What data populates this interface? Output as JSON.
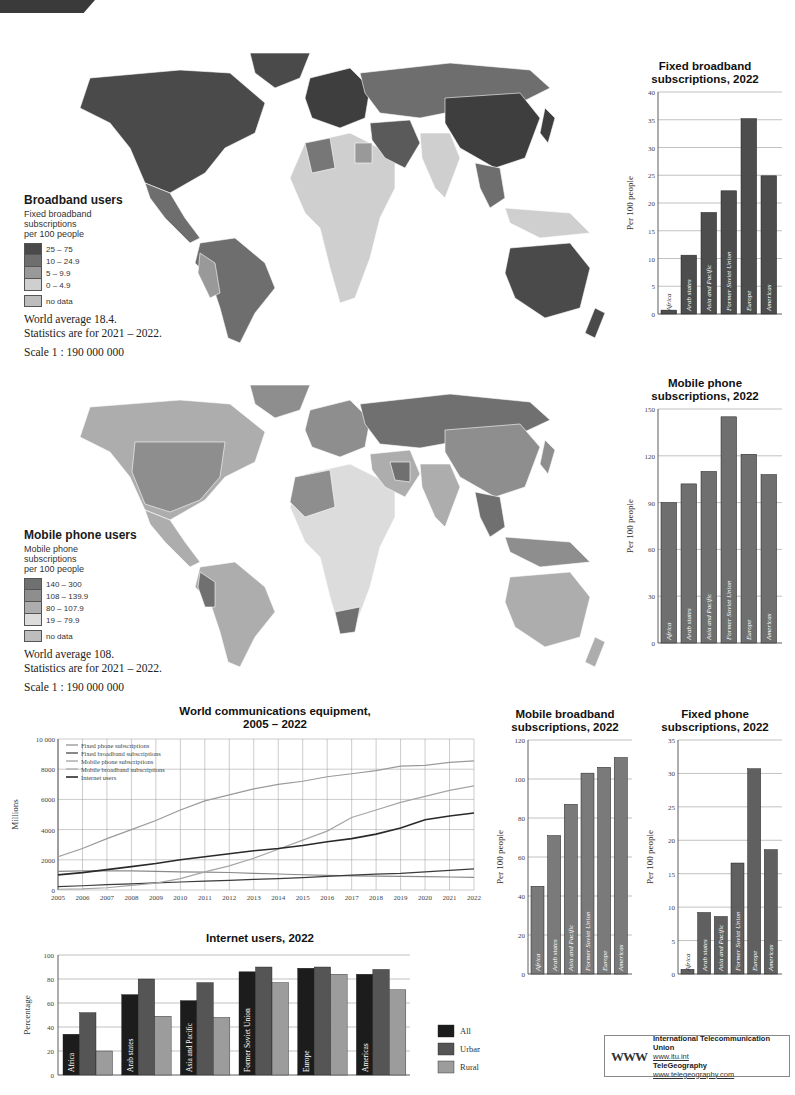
{
  "maps": {
    "broadband": {
      "title": "Broadband users",
      "subtitle": [
        "Fixed broadband",
        "subscriptions",
        "per 100 people"
      ],
      "legend": [
        {
          "label": "25 – 75",
          "color": "#4a4a4a"
        },
        {
          "label": "10 – 24.9",
          "color": "#6e6e6e"
        },
        {
          "label": "5 – 9.9",
          "color": "#999999"
        },
        {
          "label": "0 – 4.9",
          "color": "#cfcfcf"
        }
      ],
      "nodata": {
        "label": "no  data",
        "color": "#bdbdbd"
      },
      "average": "World average 18.4.",
      "stats": "Statistics are for 2021 – 2022.",
      "scale": "Scale 1 : 190 000 000"
    },
    "mobile": {
      "title": "Mobile phone users",
      "subtitle": [
        "Mobile phone",
        "subscriptions",
        "per 100 people"
      ],
      "legend": [
        {
          "label": "140 – 300",
          "color": "#707070"
        },
        {
          "label": "108 – 139.9",
          "color": "#8e8e8e"
        },
        {
          "label": "80 – 107.9",
          "color": "#adadad"
        },
        {
          "label": "19 – 79.9",
          "color": "#dcdcdc"
        }
      ],
      "nodata": {
        "label": "no  data",
        "color": "#bdbdbd"
      },
      "average": "World average 108.",
      "stats": "Statistics are for 2021 – 2022.",
      "scale": "Scale 1 : 190 000 000"
    }
  },
  "chart_data": [
    {
      "id": "fixed_broadband",
      "type": "bar",
      "title": "Fixed broadband subscriptions, 2022",
      "title_lines": [
        "Fixed broadband",
        "subscriptions, 2022"
      ],
      "ylabel": "Per 100 people",
      "ylim": [
        0,
        40
      ],
      "yticks": [
        0,
        5,
        10,
        15,
        20,
        25,
        30,
        35,
        40
      ],
      "categories": [
        "Africa",
        "Arab states",
        "Asia and Pacific",
        "Former Soviet Union",
        "Europe",
        "Americas"
      ],
      "values": [
        0.7,
        10.6,
        18.3,
        22.2,
        35.2,
        24.9
      ],
      "color": "#4d4d4d"
    },
    {
      "id": "mobile_phone",
      "type": "bar",
      "title": "Mobile phone subscriptions, 2022",
      "title_lines": [
        "Mobile phone",
        "subscriptions, 2022"
      ],
      "ylabel": "Per 100 people",
      "ylim": [
        0,
        150
      ],
      "yticks": [
        0,
        30,
        60,
        90,
        120,
        150
      ],
      "categories": [
        "Africa",
        "Arab states",
        "Asia and Pacific",
        "Former Soviet Union",
        "Europe",
        "Americas"
      ],
      "values": [
        90,
        102,
        110,
        145,
        121,
        108
      ],
      "color": "#6f6f6f"
    },
    {
      "id": "world_equipment",
      "type": "line",
      "title": "World communications equipment, 2005 – 2022",
      "title_lines": [
        "World communications equipment,",
        "2005 – 2022"
      ],
      "ylabel": "Millions",
      "ylim": [
        0,
        10000
      ],
      "yticks": [
        0,
        2000,
        4000,
        6000,
        8000,
        10000
      ],
      "ytick_labels": [
        "0",
        "2000",
        "4000",
        "6000",
        "8000",
        "10 000"
      ],
      "x": [
        2005,
        2006,
        2007,
        2008,
        2009,
        2010,
        2011,
        2012,
        2013,
        2014,
        2015,
        2016,
        2017,
        2018,
        2019,
        2020,
        2021,
        2022
      ],
      "legend_position": "top-left",
      "series": [
        {
          "name": "Fixed phone subscriptions",
          "color": "#8a8a8a",
          "width": 1.2,
          "values": [
            1240,
            1260,
            1270,
            1260,
            1230,
            1200,
            1180,
            1160,
            1100,
            1060,
            1010,
            970,
            940,
            920,
            900,
            880,
            860,
            840
          ]
        },
        {
          "name": "Fixed broadband subscriptions",
          "color": "#3a3a3a",
          "width": 1.2,
          "values": [
            220,
            280,
            350,
            410,
            470,
            530,
            590,
            640,
            700,
            750,
            820,
            900,
            980,
            1050,
            1100,
            1200,
            1300,
            1400
          ]
        },
        {
          "name": "Mobile phone subscriptions",
          "color": "#9a9a9a",
          "width": 1.2,
          "values": [
            2200,
            2750,
            3400,
            4000,
            4600,
            5300,
            5900,
            6300,
            6700,
            7000,
            7200,
            7500,
            7700,
            7900,
            8200,
            8250,
            8450,
            8550
          ]
        },
        {
          "name": "Mobile broadband subscriptions",
          "color": "#a5a5a5",
          "width": 1.2,
          "values": [
            50,
            80,
            150,
            300,
            450,
            750,
            1200,
            1600,
            2100,
            2700,
            3300,
            3900,
            4800,
            5300,
            5800,
            6200,
            6600,
            6900
          ]
        },
        {
          "name": "Internet users",
          "color": "#2a2a2a",
          "width": 1.6,
          "values": [
            1000,
            1150,
            1350,
            1550,
            1750,
            2000,
            2200,
            2400,
            2600,
            2750,
            2950,
            3200,
            3400,
            3700,
            4100,
            4650,
            4900,
            5100
          ]
        }
      ]
    },
    {
      "id": "mobile_broadband",
      "type": "bar",
      "title": "Mobile broadband subscriptions, 2022",
      "title_lines": [
        "Mobile broadband",
        "subscriptions, 2022"
      ],
      "ylabel": "Per 100 people",
      "ylim": [
        0,
        120
      ],
      "yticks": [
        0,
        20,
        40,
        60,
        80,
        100,
        120
      ],
      "categories": [
        "Africa",
        "Arab states",
        "Asia and Pacific",
        "Former Soviet Union",
        "Europe",
        "Americas"
      ],
      "values": [
        45,
        71,
        87,
        103,
        106,
        111
      ],
      "color": "#7a7a7a"
    },
    {
      "id": "fixed_phone",
      "type": "bar",
      "title": "Fixed phone subscriptions, 2022",
      "title_lines": [
        "Fixed phone",
        "subscriptions, 2022"
      ],
      "ylabel": "Per 100 people",
      "ylim": [
        0,
        35
      ],
      "yticks": [
        0,
        5,
        10,
        15,
        20,
        25,
        30,
        35
      ],
      "categories": [
        "Africa",
        "Arab states",
        "Asia and Pacific",
        "Former Soviet Union",
        "Europe",
        "Americas"
      ],
      "values": [
        0.7,
        9.2,
        8.6,
        16.6,
        30.7,
        18.6
      ],
      "color": "#606060"
    },
    {
      "id": "internet_users",
      "type": "bar",
      "title": "Internet users, 2022",
      "title_lines": [
        "Internet users, 2022"
      ],
      "ylabel": "Percentage",
      "ylim": [
        0,
        100
      ],
      "yticks": [
        0,
        20,
        40,
        60,
        80,
        100
      ],
      "categories": [
        "Africa",
        "Arab states",
        "Asia and Pacific",
        "Former Soviet Union",
        "Europe",
        "Americas"
      ],
      "legend_position": "right",
      "series": [
        {
          "name": "All",
          "color": "#1c1c1c",
          "values": [
            34,
            67,
            62,
            86,
            89,
            84
          ]
        },
        {
          "name": "Urban",
          "color": "#555555",
          "values": [
            52,
            80,
            77,
            90,
            90,
            88
          ]
        },
        {
          "name": "Rural",
          "color": "#9c9c9c",
          "values": [
            20,
            49,
            48,
            77,
            84,
            71
          ]
        }
      ]
    }
  ],
  "credits": {
    "logo": "WWW",
    "org1": "International Telecommunication Union",
    "url1": "www.itu.int",
    "org2": "TeleGeography",
    "url2": "www.telegeography.com"
  }
}
